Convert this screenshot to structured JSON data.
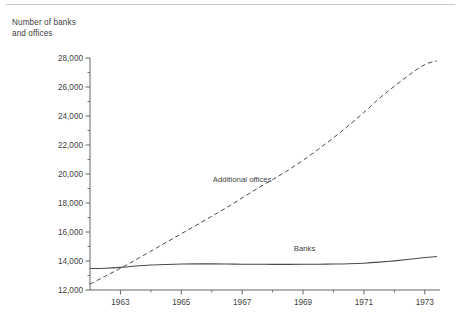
{
  "page": {
    "rule_color": "#c9c9c9",
    "background": "#ffffff"
  },
  "axis_title": "Number of banks and offices",
  "chart_data": {
    "type": "line",
    "title": "",
    "subtitle": "",
    "xlabel": "",
    "ylabel": "Number of banks and offices",
    "xlim": [
      1962,
      1973.5
    ],
    "ylim": [
      12000,
      28000
    ],
    "grid": false,
    "legend_position": "inline-annotation",
    "y_ticks": [
      12000,
      14000,
      16000,
      18000,
      20000,
      22000,
      24000,
      26000,
      28000
    ],
    "y_tick_labels": [
      "12,000",
      "14,000",
      "16,000",
      "18,000",
      "20,000",
      "22,000",
      "24,000",
      "26,000",
      "28,000"
    ],
    "y_minor_ticks": [
      13000,
      15000,
      17000,
      19000,
      21000,
      23000,
      25000,
      27000
    ],
    "x_ticks": [
      1963,
      1965,
      1967,
      1969,
      1971,
      1973
    ],
    "x_tick_labels": [
      "1963",
      "1965",
      "1967",
      "1969",
      "1971",
      "1973"
    ],
    "x_minor_ticks": [
      1962,
      1964,
      1966,
      1968,
      1970,
      1972
    ],
    "series": [
      {
        "name": "Additional offices",
        "style": "dashed",
        "color": "#4a4a4a",
        "label_x": 1967.0,
        "label_y": 19450,
        "x": [
          1962,
          1962.5,
          1963,
          1963.5,
          1964,
          1964.5,
          1965,
          1965.5,
          1966,
          1966.5,
          1967,
          1967.5,
          1968,
          1968.5,
          1969,
          1969.5,
          1970,
          1970.5,
          1971,
          1971.5,
          1972,
          1972.5,
          1973,
          1973.4
        ],
        "values": [
          12400,
          12950,
          13500,
          14080,
          14680,
          15280,
          15880,
          16480,
          17080,
          17700,
          18350,
          19000,
          19620,
          20250,
          20950,
          21700,
          22500,
          23350,
          24250,
          25200,
          26050,
          26850,
          27550,
          27800
        ]
      },
      {
        "name": "Banks",
        "style": "solid",
        "color": "#4a4a4a",
        "label_x": 1969.05,
        "label_y": 14720,
        "x": [
          1962,
          1962.5,
          1963,
          1963.5,
          1964,
          1964.5,
          1965,
          1965.5,
          1966,
          1966.5,
          1967,
          1967.5,
          1968,
          1968.5,
          1969,
          1969.5,
          1970,
          1970.5,
          1971,
          1971.5,
          1972,
          1972.5,
          1973,
          1973.4
        ],
        "values": [
          13480,
          13500,
          13560,
          13650,
          13720,
          13760,
          13790,
          13800,
          13800,
          13790,
          13780,
          13775,
          13770,
          13770,
          13775,
          13780,
          13790,
          13810,
          13850,
          13920,
          14010,
          14120,
          14240,
          14310
        ]
      }
    ],
    "annotations": [
      {
        "text": "Additional offices",
        "series": "Additional offices"
      },
      {
        "text": "Banks",
        "series": "Banks"
      }
    ]
  },
  "geometry": {
    "plot_left": 90,
    "plot_right": 440,
    "plot_top": 58,
    "plot_bottom": 290
  }
}
